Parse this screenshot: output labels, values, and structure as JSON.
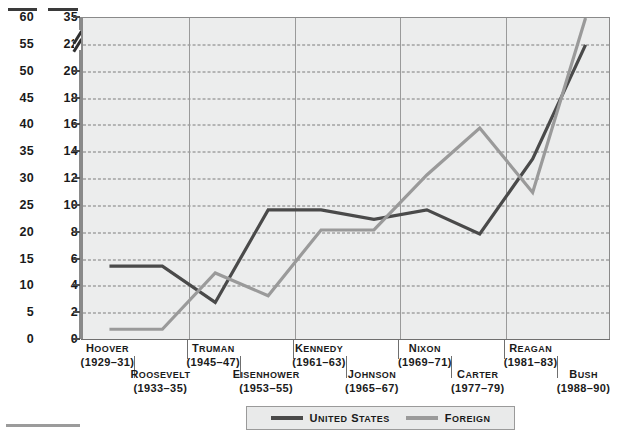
{
  "chart_data": {
    "type": "line",
    "title": "",
    "subtitle": "",
    "xlabel": "",
    "ylabel": "",
    "grid": true,
    "legend_position": "bottom-center",
    "categories": [
      "Hoover (1929–31)",
      "Roosevelt (1933–35)",
      "Truman (1945–47)",
      "Eisenhower (1953–55)",
      "Kennedy (1961–63)",
      "Johnson (1965–67)",
      "Nixon (1969–71)",
      "Carter (1977–79)",
      "Reagan (1981–83)",
      "Bush (1988–90)"
    ],
    "series": [
      {
        "name": "United States",
        "color": "#4a4a4a",
        "values": [
          5.5,
          5.5,
          2.8,
          9.7,
          9.7,
          9.0,
          9.7,
          7.9,
          13.5,
          22.0
        ]
      },
      {
        "name": "Foreign",
        "color": "#9a9a9a",
        "values": [
          0.8,
          0.8,
          5.0,
          3.3,
          8.2,
          8.2,
          12.3,
          15.8,
          11.0,
          35.0
        ]
      }
    ],
    "axes": {
      "left": {
        "ticks": [
          0,
          5,
          10,
          15,
          20,
          25,
          30,
          35,
          40,
          45,
          50,
          55,
          60
        ],
        "min": 0,
        "max": 60,
        "broken": false
      },
      "right": {
        "ticks": [
          0,
          2,
          4,
          6,
          8,
          10,
          12,
          14,
          16,
          18,
          20,
          22,
          35
        ],
        "min": 0,
        "max": 35,
        "broken": true,
        "break_between": [
          22,
          35
        ]
      }
    }
  },
  "x_axis": {
    "labels": [
      {
        "name": "Hoover",
        "years": "(1929–31)",
        "row": 1
      },
      {
        "name": "Roosevelt",
        "years": "(1933–35)",
        "row": 2
      },
      {
        "name": "Truman",
        "years": "(1945–47)",
        "row": 1
      },
      {
        "name": "Eisenhower",
        "years": "(1953–55)",
        "row": 2
      },
      {
        "name": "Kennedy",
        "years": "(1961–63)",
        "row": 1
      },
      {
        "name": "Johnson",
        "years": "(1965–67)",
        "row": 2
      },
      {
        "name": "Nixon",
        "years": "(1969–71)",
        "row": 1
      },
      {
        "name": "Carter",
        "years": "(1977–79)",
        "row": 2
      },
      {
        "name": "Reagan",
        "years": "(1981–83)",
        "row": 1
      },
      {
        "name": "Bush",
        "years": "(1988–90)",
        "row": 2
      }
    ]
  },
  "legend": {
    "items": [
      {
        "label": "United States",
        "color": "#4a4a4a"
      },
      {
        "label": "Foreign",
        "color": "#9a9a9a"
      }
    ]
  },
  "colors": {
    "plot_background": "#eceded",
    "gridline": "#7d7d7d",
    "axis": "#8a8a8a",
    "united_states": "#4a4a4a",
    "foreign": "#9a9a9a"
  }
}
